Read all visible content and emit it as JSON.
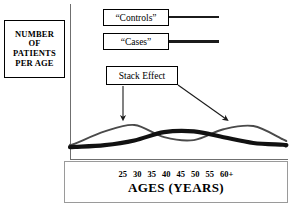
{
  "figure": {
    "y_axis_caption_lines": [
      "NUMBER",
      "OF",
      "PATIENTS",
      "PER AGE"
    ],
    "x_axis_title": "AGES (YEARS)",
    "annotation_label": "Stack Effect"
  },
  "legend": {
    "items": [
      {
        "label": "“Controls”",
        "color": "#1b1b1b"
      },
      {
        "label": "“Cases”",
        "color": "#1b1b1b"
      }
    ]
  },
  "chart_data": {
    "type": "line",
    "title": "",
    "subtitle": "",
    "xlabel": "AGES (YEARS)",
    "ylabel": "NUMBER OF PATIENTS PER AGE",
    "grid": false,
    "legend_position": "top-left",
    "x": [
      25,
      30,
      35,
      40,
      45,
      50,
      55,
      60
    ],
    "tick_labels": [
      "25",
      "30",
      "35",
      "40",
      "45",
      "50",
      "55",
      "60+"
    ],
    "xlim": [
      25,
      60
    ],
    "ylim": [
      0,
      10
    ],
    "series": [
      {
        "name": "“Controls”",
        "style": "thin",
        "color": "#4a4a4a",
        "values": [
          1.2,
          4.6,
          6.4,
          3.0,
          2.2,
          5.2,
          6.1,
          2.4
        ]
      },
      {
        "name": "“Cases”",
        "style": "thick",
        "color": "#111111",
        "values": [
          0.3,
          0.8,
          2.1,
          4.4,
          4.6,
          3.0,
          1.4,
          0.9
        ]
      }
    ],
    "annotations": [
      {
        "text": "Stack Effect",
        "points_to": [
          33,
          6.4
        ]
      },
      {
        "text": "Stack Effect",
        "points_to": [
          52,
          6.1
        ]
      }
    ]
  }
}
